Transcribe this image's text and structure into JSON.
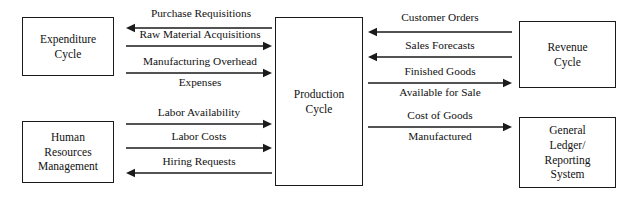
{
  "diagram": {
    "type": "data-flow-diagram",
    "canvas": {
      "width": 633,
      "height": 202
    },
    "colors": {
      "stroke": "#1a1a1a",
      "text": "#111111",
      "background": "#ffffff"
    },
    "nodes": [
      {
        "id": "expenditure-cycle",
        "label": "Expenditure\nCycle",
        "x": 22,
        "y": 17,
        "width": 92,
        "height": 59
      },
      {
        "id": "human-resources-management",
        "label": "Human\nResources\nManagement",
        "x": 22,
        "y": 121,
        "width": 92,
        "height": 62
      },
      {
        "id": "production-cycle",
        "label": "Production\nCycle",
        "x": 275,
        "y": 17,
        "width": 88,
        "height": 169
      },
      {
        "id": "revenue-cycle",
        "label": "Revenue\nCycle",
        "x": 519,
        "y": 21,
        "width": 97,
        "height": 67
      },
      {
        "id": "general-ledger-reporting-system",
        "label": "General\nLedger/\nReporting\nSystem",
        "x": 519,
        "y": 117,
        "width": 97,
        "height": 71
      }
    ],
    "flows": [
      {
        "id": "purchase-requisitions",
        "label": "Purchase Requisitions",
        "from": "production-cycle",
        "to": "expenditure-cycle",
        "direction": "left",
        "x1": 126,
        "x2": 272,
        "y": 28,
        "label_x": 128,
        "label_y": 7,
        "label_width": 146
      },
      {
        "id": "raw-material-acquisitions",
        "label": "Raw Material Acquisitions",
        "from": "expenditure-cycle",
        "to": "production-cycle",
        "direction": "right",
        "x1": 126,
        "x2": 272,
        "y": 46,
        "label_x": 120,
        "label_y": 28,
        "label_width": 160
      },
      {
        "id": "manufacturing-overhead-expenses",
        "label": "Manufacturing Overhead\nExpenses",
        "from": "expenditure-cycle",
        "to": "production-cycle",
        "direction": "right",
        "x1": 126,
        "x2": 272,
        "y": 73,
        "label_x": 122,
        "label_y": 55,
        "label_width": 156,
        "label_split": {
          "above": "Manufacturing Overhead",
          "below": "Expenses"
        }
      },
      {
        "id": "labor-availability",
        "label": "Labor Availability",
        "from": "human-resources-management",
        "to": "production-cycle",
        "direction": "right",
        "x1": 126,
        "x2": 272,
        "y": 124,
        "label_x": 126,
        "label_y": 106,
        "label_width": 146
      },
      {
        "id": "labor-costs",
        "label": "Labor Costs",
        "from": "human-resources-management",
        "to": "production-cycle",
        "direction": "right",
        "x1": 126,
        "x2": 272,
        "y": 148,
        "label_x": 126,
        "label_y": 130,
        "label_width": 146
      },
      {
        "id": "hiring-requests",
        "label": "Hiring Requests",
        "from": "production-cycle",
        "to": "human-resources-management",
        "direction": "left",
        "x1": 126,
        "x2": 272,
        "y": 173,
        "label_x": 126,
        "label_y": 155,
        "label_width": 146
      },
      {
        "id": "customer-orders",
        "label": "Customer Orders",
        "from": "revenue-cycle",
        "to": "production-cycle",
        "direction": "left",
        "x1": 368,
        "x2": 512,
        "y": 32,
        "label_x": 368,
        "label_y": 11,
        "label_width": 144
      },
      {
        "id": "sales-forecasts",
        "label": "Sales Forecasts",
        "from": "revenue-cycle",
        "to": "production-cycle",
        "direction": "left",
        "x1": 368,
        "x2": 512,
        "y": 57,
        "label_x": 368,
        "label_y": 39,
        "label_width": 144
      },
      {
        "id": "finished-goods-available-for-sale",
        "label": "Finished Goods\nAvailable for Sale",
        "from": "production-cycle",
        "to": "revenue-cycle",
        "direction": "right",
        "x1": 368,
        "x2": 512,
        "y": 83,
        "label_x": 368,
        "label_y": 65,
        "label_width": 144,
        "label_split": {
          "above": "Finished Goods",
          "below": "Available for Sale"
        }
      },
      {
        "id": "cost-of-goods-manufactured",
        "label": "Cost of Goods\nManufactured",
        "from": "production-cycle",
        "to": "general-ledger-reporting-system",
        "direction": "right",
        "x1": 368,
        "x2": 512,
        "y": 127,
        "label_x": 368,
        "label_y": 109,
        "label_width": 144,
        "label_split": {
          "above": "Cost of Goods",
          "below": "Manufactured"
        }
      }
    ]
  }
}
